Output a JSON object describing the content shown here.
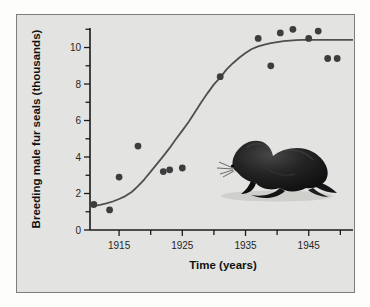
{
  "figure": {
    "outer_background": "#fdfdfb",
    "panel_background": "#e3e3e1",
    "panel_border_color": "#7d7d80"
  },
  "chart_data": {
    "type": "scatter",
    "title": "",
    "xlabel": "Time (years)",
    "ylabel": "Breeding male fur seals (thousands)",
    "xlim": [
      1910.4,
      1952.0
    ],
    "ylim": [
      0,
      11.07
    ],
    "grid": false,
    "legend": "none",
    "x_ticks": [
      1915,
      1920,
      1925,
      1930,
      1935,
      1940,
      1945,
      1950
    ],
    "x_tick_labels": [
      1915,
      1925,
      1935,
      1945
    ],
    "y_ticks": [
      0,
      1,
      2,
      3,
      4,
      5,
      6,
      7,
      8,
      9,
      10,
      11
    ],
    "y_tick_labels": [
      0,
      2,
      4,
      6,
      8,
      10
    ],
    "axis_color": "#1a1a1a",
    "point_color": "#3d3d3d",
    "point_radius": 3.4,
    "curve_color": "#4f4f4d",
    "points": [
      {
        "year": 1911,
        "value": 1.4
      },
      {
        "year": 1913.5,
        "value": 1.1
      },
      {
        "year": 1915,
        "value": 2.9
      },
      {
        "year": 1918,
        "value": 4.6
      },
      {
        "year": 1922,
        "value": 3.2
      },
      {
        "year": 1923,
        "value": 3.3
      },
      {
        "year": 1925,
        "value": 3.4
      },
      {
        "year": 1931,
        "value": 8.4
      },
      {
        "year": 1937,
        "value": 10.5
      },
      {
        "year": 1939,
        "value": 9.0
      },
      {
        "year": 1940.5,
        "value": 10.8
      },
      {
        "year": 1942.5,
        "value": 11.0
      },
      {
        "year": 1945,
        "value": 10.5
      },
      {
        "year": 1946.5,
        "value": 10.9
      },
      {
        "year": 1948,
        "value": 9.4
      },
      {
        "year": 1949.5,
        "value": 9.4
      }
    ],
    "curve": {
      "description": "logistic growth curve, carrying capacity ~10.4 thousand",
      "points": [
        [
          1910.4,
          1.28
        ],
        [
          1911,
          1.32
        ],
        [
          1912,
          1.38
        ],
        [
          1913,
          1.46
        ],
        [
          1914,
          1.56
        ],
        [
          1915,
          1.7
        ],
        [
          1916,
          1.86
        ],
        [
          1917,
          2.08
        ],
        [
          1918,
          2.4
        ],
        [
          1919,
          2.78
        ],
        [
          1920,
          3.2
        ],
        [
          1921,
          3.62
        ],
        [
          1922,
          4.05
        ],
        [
          1923,
          4.5
        ],
        [
          1924,
          4.98
        ],
        [
          1925,
          5.45
        ],
        [
          1926,
          5.92
        ],
        [
          1927,
          6.45
        ],
        [
          1928,
          7.0
        ],
        [
          1929,
          7.5
        ],
        [
          1930,
          7.98
        ],
        [
          1931,
          8.35
        ],
        [
          1932,
          8.8
        ],
        [
          1933,
          9.14
        ],
        [
          1934,
          9.44
        ],
        [
          1935,
          9.7
        ],
        [
          1936,
          9.92
        ],
        [
          1937,
          10.06
        ],
        [
          1938,
          10.16
        ],
        [
          1939,
          10.24
        ],
        [
          1940,
          10.3
        ],
        [
          1941,
          10.35
        ],
        [
          1942,
          10.38
        ],
        [
          1943,
          10.4
        ],
        [
          1944,
          10.42
        ],
        [
          1952,
          10.42
        ]
      ]
    },
    "illustration": "fur seal (dark, facing left) inside plot area"
  }
}
